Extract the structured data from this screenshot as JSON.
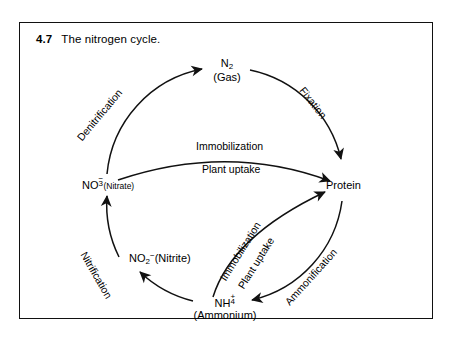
{
  "figure": {
    "number": "4.7",
    "caption": "The nitrogen cycle."
  },
  "nodes": {
    "n2": {
      "formula_main": "N",
      "formula_sub": "2",
      "secondary": "(Gas)"
    },
    "protein": {
      "label": "Protein"
    },
    "ammonium": {
      "formula_main": "NH",
      "charge_sub": "4",
      "charge_sup": "+",
      "secondary": "(Ammonium)"
    },
    "nitrite": {
      "formula_main": "NO",
      "formula_sub": "2",
      "formula_sup": "−",
      "secondary": "(Nitrite)"
    },
    "nitrate": {
      "formula_main": "NO",
      "charge_sub": "3",
      "charge_sup": "−",
      "secondary": "(Nitrate)"
    }
  },
  "processes": {
    "denitrification": "Denitrification",
    "fixation": "Fixation",
    "ammonification": "Ammonification",
    "nitrification": "Nitrification",
    "immobilization_upper": "Immobilization",
    "plant_uptake_upper": "Plant uptake",
    "immobilization_lower": "Immobilization",
    "plant_uptake_lower": "Plant uptake"
  },
  "style": {
    "ink": "#111111",
    "paper": "#ffffff"
  }
}
